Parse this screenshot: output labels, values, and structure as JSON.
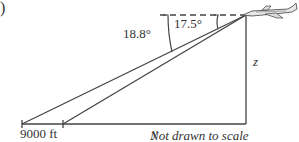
{
  "figure": {
    "part_label": ")",
    "angles": {
      "outer": "18.8°",
      "inner": "17.5°"
    },
    "distance_label": "9000 ft",
    "variables": {
      "horizontal": "y",
      "vertical": "z"
    },
    "note": "Not drawn to scale",
    "icons": {
      "aircraft": "airplane-icon"
    },
    "colors": {
      "line": "#444444",
      "text": "#333333",
      "background": "#ffffff"
    }
  }
}
